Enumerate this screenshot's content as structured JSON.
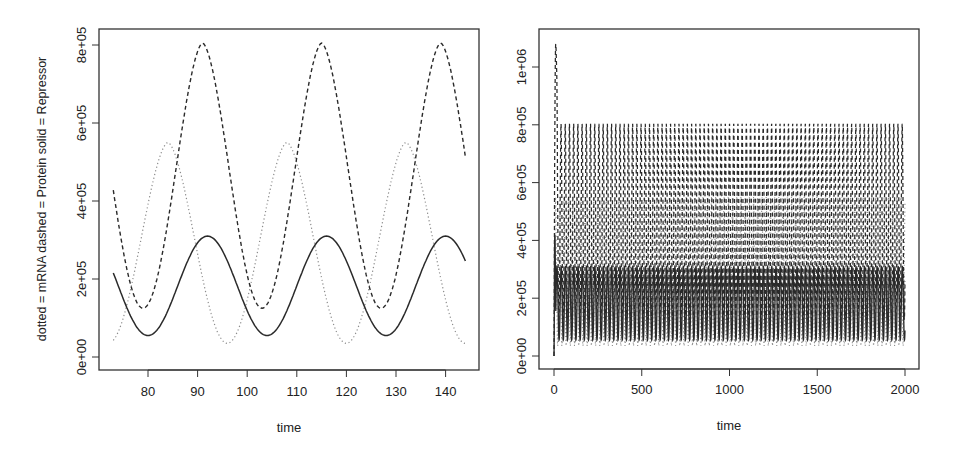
{
  "chart_data": [
    {
      "type": "line",
      "panel": "left",
      "title": "",
      "xlabel": "time",
      "ylabel": "dotted = mRNA  dashed = Protein  solid = Repressor",
      "xlim": [
        73,
        144
      ],
      "ylim": [
        0,
        800000
      ],
      "x_ticks": [
        80,
        90,
        100,
        110,
        120,
        130,
        140
      ],
      "y_ticks": [
        0,
        200000,
        400000,
        600000,
        800000
      ],
      "y_tick_labels": [
        "0e+00",
        "2e+05",
        "4e+05",
        "6e+05",
        "8e+05"
      ],
      "grid": false,
      "legend": "none (encoded in y-axis label)",
      "period": 24,
      "series": [
        {
          "name": "mRNA",
          "style": "dotted",
          "color": "#9a9a9a",
          "min": 35000,
          "max": 550000,
          "peak_times": [
            84,
            108,
            132
          ],
          "x": [
            73,
            76,
            80,
            84,
            88,
            92,
            96,
            100,
            104,
            108,
            112,
            116,
            120,
            124,
            128,
            132,
            136,
            140,
            144
          ],
          "values": [
            70000,
            35000,
            200000,
            550000,
            460000,
            300000,
            150000,
            35000,
            170000,
            550000,
            450000,
            290000,
            140000,
            35000,
            180000,
            550000,
            440000,
            280000,
            100000
          ]
        },
        {
          "name": "Protein",
          "style": "dashed",
          "color": "#333333",
          "min": 125000,
          "max": 805000,
          "peak_times": [
            91,
            115,
            139
          ],
          "x": [
            73,
            76,
            79.5,
            83,
            87,
            91,
            95,
            99,
            103.5,
            107,
            111,
            115,
            119,
            123,
            127.5,
            131,
            135,
            139,
            144
          ],
          "values": [
            570000,
            340000,
            125000,
            330000,
            690000,
            805000,
            660000,
            380000,
            125000,
            320000,
            680000,
            810000,
            650000,
            370000,
            125000,
            330000,
            690000,
            805000,
            630000
          ]
        },
        {
          "name": "Repressor",
          "style": "solid",
          "color": "#333333",
          "min": 55000,
          "max": 310000,
          "peak_times": [
            92,
            116,
            140
          ],
          "x": [
            73,
            76,
            80,
            84,
            88,
            92,
            96,
            100,
            104,
            108,
            112,
            116,
            120,
            124,
            128,
            132,
            136,
            140,
            144
          ],
          "values": [
            240000,
            150000,
            55000,
            120000,
            240000,
            310000,
            250000,
            130000,
            55000,
            130000,
            250000,
            310000,
            250000,
            130000,
            55000,
            130000,
            250000,
            310000,
            265000
          ]
        }
      ]
    },
    {
      "type": "line",
      "panel": "right",
      "title": "",
      "xlabel": "time",
      "ylabel": "",
      "xlim": [
        0,
        2000
      ],
      "ylim": [
        0,
        1080000
      ],
      "x_ticks": [
        0,
        500,
        1000,
        1500,
        2000
      ],
      "y_ticks": [
        0,
        200000,
        400000,
        600000,
        800000,
        1000000
      ],
      "y_tick_labels": [
        "0e+00",
        "2e+05",
        "4e+05",
        "6e+05",
        "8e+05",
        "1e+06"
      ],
      "grid": false,
      "period": 24,
      "cycles": 83,
      "series": [
        {
          "name": "mRNA",
          "style": "dotted",
          "min": 35000,
          "max": 550000,
          "initial": 0
        },
        {
          "name": "Protein",
          "style": "dashed",
          "min": 125000,
          "max": 805000,
          "initial_spike": 1080000,
          "spike_time": 10
        },
        {
          "name": "Repressor",
          "style": "solid",
          "min": 55000,
          "max": 310000,
          "initial_spike": 420000,
          "spike_time": 5
        }
      ]
    }
  ],
  "panels": {
    "left": {
      "xlabel": "time",
      "ylabel": "dotted = mRNA  dashed = Protein  solid = Repressor"
    },
    "right": {
      "xlabel": "time"
    }
  }
}
